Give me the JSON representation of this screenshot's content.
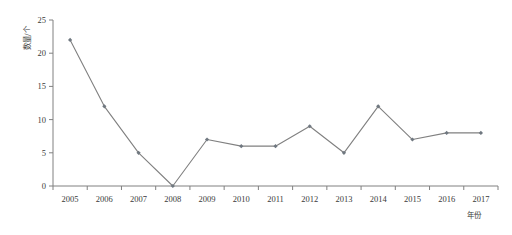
{
  "chart_data": {
    "type": "line",
    "title": "",
    "subtitle": "",
    "xlabel": "年份",
    "ylabel": "数量/个",
    "categories": [
      "2005",
      "2006",
      "2007",
      "2008",
      "2009",
      "2010",
      "2011",
      "2012",
      "2013",
      "2014",
      "2015",
      "2016",
      "2017"
    ],
    "x": [
      2005,
      2006,
      2007,
      2008,
      2009,
      2010,
      2011,
      2012,
      2013,
      2014,
      2015,
      2016,
      2017
    ],
    "values": [
      22,
      12,
      5,
      0,
      7,
      6,
      6,
      9,
      5,
      12,
      7,
      8,
      8
    ],
    "series": [
      {
        "name": "数量",
        "values": [
          22,
          12,
          5,
          0,
          7,
          6,
          6,
          9,
          5,
          12,
          7,
          8,
          8
        ]
      }
    ],
    "ylim": [
      0,
      25
    ],
    "yticks": [
      0,
      5,
      10,
      15,
      20,
      25
    ],
    "ytick_labels": [
      "0",
      "5",
      "10",
      "15",
      "20",
      "25"
    ],
    "xtick_labels": [
      "2005",
      "2006",
      "2007",
      "2008",
      "2009",
      "2010",
      "2011",
      "2012",
      "2013",
      "2014",
      "2015",
      "2016",
      "2017"
    ],
    "grid": false,
    "legend": false,
    "legend_position": "none",
    "annotations": [],
    "colors": {
      "line": "#808080",
      "marker": "#707880",
      "axis": "#808080",
      "text": "#3a3a3a",
      "background": "#ffffff"
    },
    "marker_style": "diamond",
    "line_width": 1
  },
  "axes": {
    "y_axis_title": "数量/个",
    "x_axis_title": "年份"
  }
}
